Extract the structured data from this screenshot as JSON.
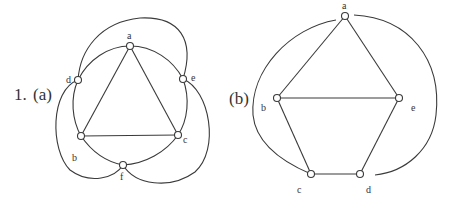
{
  "problem_number": "1.",
  "figures": [
    {
      "label": "(a)",
      "vertices": [
        {
          "name": "a",
          "x": 130,
          "y": 46
        },
        {
          "name": "d",
          "x": 78,
          "y": 80
        },
        {
          "name": "e",
          "x": 183,
          "y": 79
        },
        {
          "name": "b",
          "x": 81,
          "y": 136
        },
        {
          "name": "c",
          "x": 178,
          "y": 135
        },
        {
          "name": "f",
          "x": 123,
          "y": 165
        }
      ],
      "edges": [
        [
          "a",
          "b"
        ],
        [
          "a",
          "c"
        ],
        [
          "b",
          "c"
        ],
        [
          "a",
          "d"
        ],
        [
          "a",
          "e"
        ],
        [
          "d",
          "b"
        ],
        [
          "e",
          "c"
        ],
        [
          "b",
          "f"
        ],
        [
          "c",
          "f"
        ],
        [
          "d",
          "e"
        ],
        [
          "d",
          "f"
        ],
        [
          "e",
          "f"
        ]
      ]
    },
    {
      "label": "(b)",
      "vertices": [
        {
          "name": "a",
          "x": 345,
          "y": 16
        },
        {
          "name": "b",
          "x": 277,
          "y": 98
        },
        {
          "name": "e",
          "x": 399,
          "y": 98
        },
        {
          "name": "c",
          "x": 311,
          "y": 174
        },
        {
          "name": "d",
          "x": 360,
          "y": 174
        }
      ],
      "edges": [
        [
          "a",
          "b"
        ],
        [
          "a",
          "e"
        ],
        [
          "b",
          "e"
        ],
        [
          "b",
          "c"
        ],
        [
          "c",
          "d"
        ],
        [
          "d",
          "e"
        ],
        [
          "a",
          "c"
        ],
        [
          "a",
          "d"
        ]
      ]
    }
  ],
  "colors": {
    "stroke": "#3a3a3a",
    "background": "#ffffff"
  }
}
